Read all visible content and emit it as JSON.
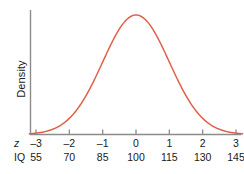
{
  "chart_data": {
    "type": "line",
    "title": "",
    "xlabel": "",
    "ylabel": "Density",
    "grid": false,
    "legend": "none",
    "curve": "normal density",
    "axes": {
      "x_rows": [
        {
          "name": "z",
          "name_style": "italic",
          "tick_labels": [
            "–3",
            "–2",
            "–1",
            "0",
            "1",
            "2",
            "3"
          ],
          "values": [
            -3,
            -2,
            -1,
            0,
            1,
            2,
            3
          ]
        },
        {
          "name": "IQ",
          "name_style": "normal",
          "tick_labels": [
            "55",
            "70",
            "85",
            "100",
            "115",
            "130",
            "145"
          ],
          "values": [
            55,
            70,
            85,
            100,
            115,
            130,
            145
          ]
        }
      ],
      "xlim": [
        -3.2,
        3.2
      ],
      "ylim": [
        0,
        0.44
      ],
      "y_ticks_shown": false
    },
    "distribution": {
      "mean_z": 0,
      "sd_z": 1,
      "mean_iq": 100,
      "sd_iq": 15
    },
    "series": [
      {
        "name": "Normal density",
        "x": [
          -3.2,
          -3,
          -2.75,
          -2.5,
          -2.25,
          -2,
          -1.75,
          -1.5,
          -1.25,
          -1,
          -0.75,
          -0.5,
          -0.25,
          0,
          0.25,
          0.5,
          0.75,
          1,
          1.25,
          1.5,
          1.75,
          2,
          2.25,
          2.5,
          2.75,
          3,
          3.2
        ],
        "y": [
          0.0023,
          0.0044,
          0.0091,
          0.0175,
          0.0317,
          0.054,
          0.0863,
          0.1295,
          0.1826,
          0.242,
          0.3011,
          0.3521,
          0.3867,
          0.3989,
          0.3867,
          0.3521,
          0.3011,
          0.242,
          0.1826,
          0.1295,
          0.0863,
          0.054,
          0.0317,
          0.0175,
          0.0091,
          0.0044,
          0.0023
        ]
      }
    ]
  },
  "style": {
    "curve_color": "#e0604a",
    "axis_color": "#8c8c8c",
    "text_color": "#1a1a1a",
    "background": "#ffffff"
  }
}
